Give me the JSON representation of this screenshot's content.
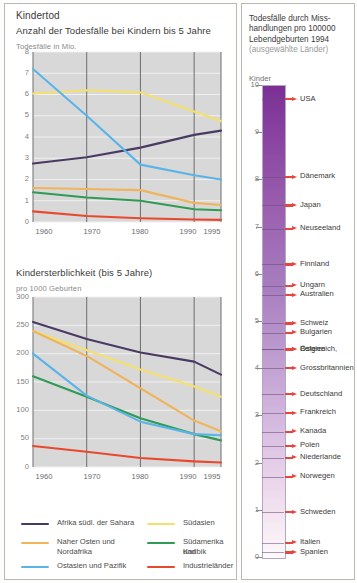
{
  "left": {
    "title": "Kindertod",
    "chart1": {
      "subtitle": "Anzahl der Todesfälle bei Kindern bis 5 Jahre",
      "unit": "Todesfälle in Mio."
    },
    "chart2": {
      "subtitle": "Kindersterblichkeit (bis 5 Jahre)",
      "unit": "pro 1000 Geburten"
    }
  },
  "right": {
    "title_line1": "Todesfälle durch Miss-",
    "title_line2": "handlungen pro 100000",
    "title_line3": "Lebendgeburten 1994",
    "title_note": "(ausgewählte Länder)",
    "axis_caption": "Kinder",
    "axis_ticks": [
      "10",
      "9",
      "8",
      "7",
      "6",
      "5",
      "4",
      "3",
      "2",
      "1",
      "0"
    ],
    "countries": [
      {
        "label": "USA",
        "value": 9.7
      },
      {
        "label": "Dänemark",
        "value": 8.05
      },
      {
        "label": "Japan",
        "value": 7.45
      },
      {
        "label": "Neuseeland",
        "value": 6.95
      },
      {
        "label": "Finnland",
        "value": 6.2
      },
      {
        "label": "Ungarn",
        "value": 5.75
      },
      {
        "label": "Australien",
        "value": 5.55
      },
      {
        "label": "Schweiz",
        "value": 4.95
      },
      {
        "label": "Bulgarien",
        "value": 4.75
      },
      {
        "label": "Österreich,",
        "value": 4.4
      },
      {
        "label": "Belgien",
        "value": 4.4
      },
      {
        "label": "Grossbritannien",
        "value": 4.0
      },
      {
        "label": "Deutschland",
        "value": 3.45
      },
      {
        "label": "Frankreich",
        "value": 3.05
      },
      {
        "label": "Kanada",
        "value": 2.65
      },
      {
        "label": "Polen",
        "value": 2.35
      },
      {
        "label": "Niederlande",
        "value": 2.1
      },
      {
        "label": "Norwegen",
        "value": 1.7
      },
      {
        "label": "Schweden",
        "value": 0.95
      },
      {
        "label": "Italien",
        "value": 0.3
      },
      {
        "label": "Spanien",
        "value": 0.1
      }
    ],
    "colors": {
      "gradient_top": "#7b2f95",
      "gradient_bottom": "#fdfafc",
      "marker": "#e8453c"
    }
  },
  "legend": [
    {
      "label": "Afrika südl. der Sahara",
      "color": "#4a3a63"
    },
    {
      "label": "Südasien",
      "color": "#f5e06a"
    },
    {
      "label": "Naher Osten und",
      "label2": "Nordafrika",
      "color": "#f0b45c"
    },
    {
      "label": "Südamerika und",
      "label2": "Karibik",
      "color": "#2f9b54"
    },
    {
      "label": "Ostasien und Pazifik",
      "color": "#5ab4e8"
    },
    {
      "label": "Industrieländer",
      "color": "#e8492c"
    }
  ],
  "chart_data": [
    {
      "type": "line",
      "title": "Anzahl der Todesfälle bei Kindern bis 5 Jahre",
      "ylabel": "Todesfälle in Mio.",
      "xlabel": "",
      "x": [
        1960,
        1970,
        1980,
        1990,
        1995
      ],
      "xticks": [
        "1960",
        "1970",
        "1980",
        "1990",
        "1995"
      ],
      "yticks": [
        "0",
        "1",
        "2",
        "3",
        "4",
        "5",
        "6",
        "7",
        "8"
      ],
      "ylim": [
        0,
        8
      ],
      "xlim": [
        1960,
        1995
      ],
      "grid": true,
      "series": [
        {
          "name": "Afrika südl. der Sahara",
          "color": "#4a3a63",
          "values": [
            2.75,
            3.05,
            3.5,
            4.1,
            4.3
          ]
        },
        {
          "name": "Südasien",
          "color": "#f5e06a",
          "values": [
            6.05,
            6.2,
            6.1,
            5.2,
            4.75
          ]
        },
        {
          "name": "Naher Osten und Nordafrika",
          "color": "#f0b45c",
          "values": [
            1.6,
            1.55,
            1.5,
            0.9,
            0.8
          ]
        },
        {
          "name": "Südamerika und Karibik",
          "color": "#2f9b54",
          "values": [
            1.4,
            1.15,
            1.0,
            0.6,
            0.55
          ]
        },
        {
          "name": "Ostasien und Pazifik",
          "color": "#5ab4e8",
          "values": [
            7.2,
            5.0,
            2.7,
            2.2,
            2.0
          ]
        },
        {
          "name": "Industrieländer",
          "color": "#e8492c",
          "values": [
            0.5,
            0.28,
            0.18,
            0.12,
            0.1
          ]
        }
      ]
    },
    {
      "type": "line",
      "title": "Kindersterblichkeit (bis 5 Jahre)",
      "ylabel": "pro 1000 Geburten",
      "xlabel": "",
      "x": [
        1960,
        1970,
        1980,
        1990,
        1995
      ],
      "xticks": [
        "1960",
        "1970",
        "1980",
        "1990",
        "1995"
      ],
      "yticks": [
        "0",
        "50",
        "100",
        "150",
        "200",
        "250",
        "300"
      ],
      "ylim": [
        0,
        300
      ],
      "xlim": [
        1960,
        1995
      ],
      "grid": true,
      "series": [
        {
          "name": "Afrika südl. der Sahara",
          "color": "#4a3a63",
          "values": [
            256,
            226,
            202,
            186,
            163
          ]
        },
        {
          "name": "Südasien",
          "color": "#f5e06a",
          "values": [
            240,
            206,
            172,
            142,
            124
          ]
        },
        {
          "name": "Naher Osten und Nordafrika",
          "color": "#f0b45c",
          "values": [
            240,
            196,
            139,
            82,
            63
          ]
        },
        {
          "name": "Südamerika und Karibik",
          "color": "#2f9b54",
          "values": [
            160,
            124,
            86,
            58,
            47
          ]
        },
        {
          "name": "Ostasien und Pazifik",
          "color": "#5ab4e8",
          "values": [
            200,
            126,
            80,
            58,
            56
          ]
        },
        {
          "name": "Industrieländer",
          "color": "#e8492c",
          "values": [
            37,
            27,
            16,
            10,
            8
          ]
        }
      ]
    }
  ]
}
